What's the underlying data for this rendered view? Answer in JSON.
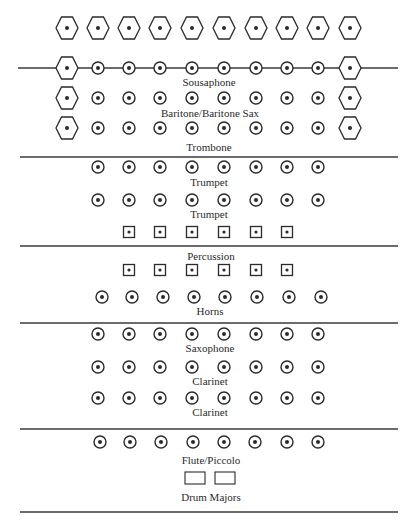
{
  "diagram": {
    "colors": {
      "ink": "#2a2a2a",
      "background": "#ffffff"
    },
    "lines": [
      {
        "y": 68,
        "x1": 18,
        "x2": 398,
        "note": "yard line through sousaphone row"
      },
      {
        "y": 157,
        "x1": 20,
        "x2": 398
      },
      {
        "y": 246,
        "x1": 20,
        "x2": 398
      },
      {
        "y": 323,
        "x1": 20,
        "x2": 398
      },
      {
        "y": 429,
        "x1": 20,
        "x2": 398
      },
      {
        "y": 512,
        "x1": 20,
        "x2": 398
      }
    ],
    "rows": [
      {
        "name": "hexagon-row-top",
        "y": 28,
        "symbol": "hexagon",
        "x": [
          67,
          98,
          129,
          160,
          192,
          224,
          256,
          287,
          318,
          350
        ]
      },
      {
        "name": "sousaphone-row",
        "y": 68,
        "symbol": "circle",
        "x": [
          98,
          129,
          160,
          192,
          224,
          256,
          287,
          318
        ],
        "flanks": {
          "symbol": "hexagon",
          "x": [
            67,
            350
          ]
        }
      },
      {
        "name": "baritone-row",
        "y": 98,
        "symbol": "circle",
        "x": [
          98,
          129,
          160,
          192,
          224,
          256,
          287,
          318
        ],
        "flanks": {
          "symbol": "hexagon",
          "x": [
            67,
            350
          ]
        }
      },
      {
        "name": "trombone-row",
        "y": 128,
        "symbol": "circle",
        "x": [
          98,
          129,
          160,
          192,
          224,
          256,
          287,
          318
        ],
        "flanks": {
          "symbol": "hexagon",
          "x": [
            67,
            350
          ]
        }
      },
      {
        "name": "trumpet-row-1",
        "y": 167,
        "symbol": "circle",
        "x": [
          98,
          129,
          160,
          192,
          224,
          256,
          287,
          318
        ]
      },
      {
        "name": "trumpet-row-2",
        "y": 200,
        "symbol": "circle",
        "x": [
          98,
          129,
          160,
          192,
          224,
          256,
          287,
          318
        ]
      },
      {
        "name": "percussion-row-1",
        "y": 232,
        "symbol": "square",
        "x": [
          129,
          160,
          192,
          224,
          256,
          287
        ]
      },
      {
        "name": "percussion-row-2",
        "y": 270,
        "symbol": "square",
        "x": [
          129,
          160,
          192,
          224,
          256,
          287
        ]
      },
      {
        "name": "horns-row",
        "y": 297,
        "symbol": "circle",
        "x": [
          102,
          132,
          163,
          194,
          225,
          257,
          289,
          321
        ]
      },
      {
        "name": "saxophone-row",
        "y": 334,
        "symbol": "circle",
        "x": [
          98,
          129,
          160,
          192,
          224,
          256,
          287,
          318
        ]
      },
      {
        "name": "clarinet-row-1",
        "y": 367,
        "symbol": "circle",
        "x": [
          98,
          129,
          160,
          192,
          224,
          256,
          287,
          318
        ]
      },
      {
        "name": "clarinet-row-2",
        "y": 398,
        "symbol": "circle",
        "x": [
          98,
          129,
          160,
          192,
          224,
          256,
          287,
          318
        ]
      },
      {
        "name": "flute-row",
        "y": 442,
        "symbol": "circle",
        "x": [
          100,
          130,
          161,
          193,
          224,
          255,
          287,
          318
        ]
      }
    ],
    "drum_majors": {
      "y": 478,
      "boxes": [
        {
          "x": 185,
          "w": 20,
          "h": 12
        },
        {
          "x": 215,
          "w": 20,
          "h": 12
        }
      ]
    },
    "labels": [
      {
        "key": "sousaphone",
        "text": "Sousaphone",
        "x": 209,
        "y": 82
      },
      {
        "key": "baritone",
        "text": "Baritone/Baritone Sax",
        "x": 210,
        "y": 113
      },
      {
        "key": "trombone",
        "text": "Trombone",
        "x": 209,
        "y": 147
      },
      {
        "key": "trumpet1",
        "text": "Trumpet",
        "x": 209,
        "y": 182
      },
      {
        "key": "trumpet2",
        "text": "Trumpet",
        "x": 209,
        "y": 214
      },
      {
        "key": "percussion",
        "text": "Percussion",
        "x": 211,
        "y": 256
      },
      {
        "key": "horns",
        "text": "Horns",
        "x": 210,
        "y": 311
      },
      {
        "key": "saxophone",
        "text": "Saxophone",
        "x": 210,
        "y": 348
      },
      {
        "key": "clarinet1",
        "text": "Clarinet",
        "x": 210,
        "y": 381
      },
      {
        "key": "clarinet2",
        "text": "Clarinet",
        "x": 210,
        "y": 412
      },
      {
        "key": "flute",
        "text": "Flute/Piccolo",
        "x": 211,
        "y": 460
      },
      {
        "key": "drum_majors",
        "text": "Drum Majors",
        "x": 211,
        "y": 497
      }
    ],
    "text": {
      "sousaphone": "Sousaphone",
      "baritone": "Baritone/Baritone Sax",
      "trombone": "Trombone",
      "trumpet1": "Trumpet",
      "trumpet2": "Trumpet",
      "percussion": "Percussion",
      "horns": "Horns",
      "saxophone": "Saxophone",
      "clarinet1": "Clarinet",
      "clarinet2": "Clarinet",
      "flute": "Flute/Piccolo",
      "drum_majors": "Drum Majors"
    },
    "legend_symbols": {
      "hexagon": "hexagon-marker-icon",
      "circle": "circle-dot-marker-icon",
      "square": "square-dot-marker-icon",
      "rectangle": "drum-major-box-icon"
    }
  }
}
